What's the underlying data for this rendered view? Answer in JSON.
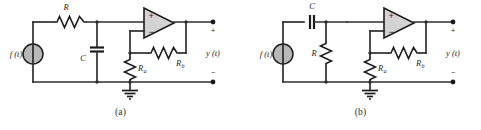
{
  "figure": {
    "background_color": "#ffffff",
    "wire_color": "#2e2e2e",
    "opamp_fill": "#d3d3d3",
    "source_fill": "#b8b8b8"
  },
  "panels": [
    {
      "id": "a",
      "caption": "(a)",
      "source_label": "f (t)",
      "output_label": "y (t)",
      "plus_sign": "+",
      "minus_sign": "−",
      "opamp_plus": "+",
      "opamp_minus": "−",
      "components": [
        {
          "name": "series-resistor",
          "label": "R",
          "sublabel": "",
          "type": "resistor",
          "orientation": "horizontal"
        },
        {
          "name": "shunt-capacitor",
          "label": "C",
          "sublabel": "",
          "type": "capacitor",
          "orientation": "vertical"
        },
        {
          "name": "feedback-resistor",
          "label": "R",
          "sublabel": "b",
          "type": "resistor",
          "orientation": "horizontal"
        },
        {
          "name": "gain-resistor",
          "label": "R",
          "sublabel": "a",
          "type": "resistor",
          "orientation": "vertical"
        },
        {
          "name": "ground",
          "label": "",
          "sublabel": "",
          "type": "ground",
          "orientation": "vertical"
        },
        {
          "name": "voltage-source",
          "label": "f (t)",
          "sublabel": "",
          "type": "source",
          "orientation": "vertical"
        },
        {
          "name": "operational-amplifier",
          "label": "",
          "sublabel": "",
          "type": "opamp",
          "orientation": "horizontal"
        }
      ]
    },
    {
      "id": "b",
      "caption": "(b)",
      "source_label": "f (t)",
      "output_label": "y (t)",
      "plus_sign": "+",
      "minus_sign": "−",
      "opamp_plus": "+",
      "opamp_minus": "−",
      "components": [
        {
          "name": "series-capacitor",
          "label": "C",
          "sublabel": "",
          "type": "capacitor",
          "orientation": "horizontal"
        },
        {
          "name": "shunt-resistor",
          "label": "R",
          "sublabel": "",
          "type": "resistor",
          "orientation": "vertical"
        },
        {
          "name": "feedback-resistor",
          "label": "R",
          "sublabel": "b",
          "type": "resistor",
          "orientation": "horizontal"
        },
        {
          "name": "gain-resistor",
          "label": "R",
          "sublabel": "a",
          "type": "resistor",
          "orientation": "vertical"
        },
        {
          "name": "ground",
          "label": "",
          "sublabel": "",
          "type": "ground",
          "orientation": "vertical"
        },
        {
          "name": "voltage-source",
          "label": "f (t)",
          "sublabel": "",
          "type": "source",
          "orientation": "vertical"
        },
        {
          "name": "operational-amplifier",
          "label": "",
          "sublabel": "",
          "type": "opamp",
          "orientation": "horizontal"
        }
      ]
    }
  ]
}
